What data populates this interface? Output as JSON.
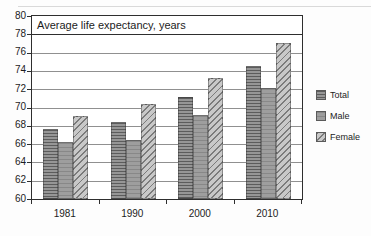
{
  "chart_data": {
    "type": "bar",
    "title": "Average life expectancy, years",
    "xlabel": "",
    "ylabel": "",
    "categories": [
      "1981",
      "1990",
      "2000",
      "2010"
    ],
    "series": [
      {
        "name": "Total",
        "pattern": "horizontal-stripes",
        "values": [
          67.7,
          68.4,
          71.1,
          74.5
        ]
      },
      {
        "name": "Male",
        "pattern": "solid-gray",
        "values": [
          66.2,
          66.4,
          69.2,
          72.1
        ]
      },
      {
        "name": "Female",
        "pattern": "diagonal-hatch",
        "values": [
          69.1,
          70.4,
          73.2,
          77.1
        ]
      }
    ],
    "ylim": [
      60,
      80
    ],
    "yticks": [
      60,
      62,
      64,
      66,
      68,
      70,
      72,
      74,
      76,
      78,
      80
    ],
    "grid": true,
    "legend_position": "right",
    "legend": [
      "Total",
      "Male",
      "Female"
    ]
  },
  "colors": {
    "axis": "#2e2e2e",
    "grid": "#909090",
    "text": "#1c1c1c",
    "total_base": "#969696",
    "total_stripe": "#5c5c5c",
    "male_base": "#9e9e9e",
    "male_stripe": "#888888",
    "female_base": "#c8c8c8",
    "female_stripe": "#7b7b7b"
  }
}
